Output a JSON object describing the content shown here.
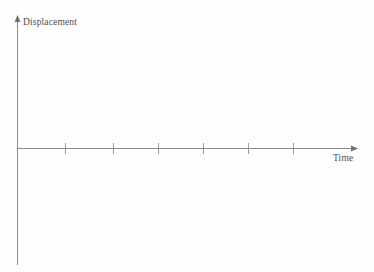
{
  "chart_data": {
    "type": "line",
    "title": "",
    "subtitle": "",
    "xlabel": "Time",
    "ylabel": "Displacement",
    "x": [],
    "values": [],
    "series": [],
    "annotations": [],
    "grid": false,
    "legend": null,
    "legend_position": "none",
    "xlim": [
      0,
      7
    ],
    "ylim": [
      -3.5,
      3.5
    ],
    "x_tick_count": 6,
    "x_tick_labels": [
      "",
      "",
      "",
      "",
      "",
      ""
    ],
    "y_tick_labels": [],
    "colors": {
      "background": "#fefefe",
      "axis": "#8c8c8c",
      "tick": "#8c8c8c",
      "text": "#4d4d4d"
    }
  },
  "axes": {
    "y_axis": {
      "label": "Displacement",
      "arrow": "arrow-up"
    },
    "x_axis": {
      "label": "Time",
      "arrow": "arrow-right",
      "ticks": [
        {
          "index": 1,
          "x": 65,
          "label": ""
        },
        {
          "index": 2,
          "x": 113,
          "label": ""
        },
        {
          "index": 3,
          "x": 158,
          "label": ""
        },
        {
          "index": 4,
          "x": 203,
          "label": ""
        },
        {
          "index": 5,
          "x": 248,
          "label": ""
        },
        {
          "index": 6,
          "x": 293,
          "label": ""
        }
      ]
    }
  }
}
